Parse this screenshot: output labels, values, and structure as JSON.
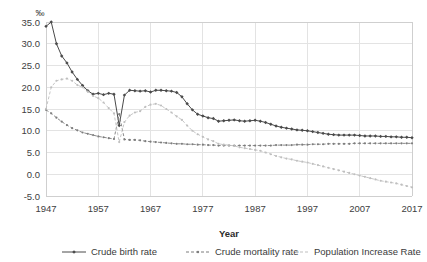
{
  "chart_data": {
    "type": "line",
    "title": "",
    "xlabel": "Year",
    "ylabel": "",
    "unit_symbol": "‰",
    "xlim": [
      1947,
      2017
    ],
    "ylim": [
      -5.0,
      35.0
    ],
    "grid": true,
    "legend_position": "bottom",
    "x_tick_labels": [
      "1947",
      "1957",
      "1967",
      "1977",
      "1987",
      "1997",
      "2007",
      "2017"
    ],
    "x_ticks": [
      1947,
      1957,
      1967,
      1977,
      1987,
      1997,
      2007,
      2017
    ],
    "y_tick_labels": [
      "-5.0",
      "0.0",
      "5.0",
      "10.0",
      "15.0",
      "20.0",
      "25.0",
      "30.0",
      "35.0"
    ],
    "y_ticks": [
      -5,
      0,
      5,
      10,
      15,
      20,
      25,
      30,
      35
    ],
    "x": [
      1947,
      1948,
      1949,
      1950,
      1951,
      1952,
      1953,
      1954,
      1955,
      1956,
      1957,
      1958,
      1959,
      1960,
      1961,
      1962,
      1963,
      1964,
      1965,
      1966,
      1967,
      1968,
      1969,
      1970,
      1971,
      1972,
      1973,
      1974,
      1975,
      1976,
      1977,
      1978,
      1979,
      1980,
      1981,
      1982,
      1983,
      1984,
      1985,
      1986,
      1987,
      1988,
      1989,
      1990,
      1991,
      1992,
      1993,
      1994,
      1995,
      1996,
      1997,
      1998,
      1999,
      2000,
      2001,
      2002,
      2003,
      2004,
      2005,
      2006,
      2007,
      2008,
      2009,
      2010,
      2011,
      2012,
      2013,
      2014,
      2015,
      2016,
      2017
    ],
    "series": [
      {
        "name": "Crude birth rate",
        "color": "#4a4a4a",
        "marker": "diamond",
        "dash": "none",
        "values": [
          34.0,
          35.0,
          30.0,
          27.2,
          25.6,
          23.5,
          21.8,
          20.4,
          19.2,
          18.4,
          18.6,
          18.3,
          18.6,
          18.4,
          11.2,
          18.2,
          19.3,
          19.2,
          19.1,
          19.2,
          18.9,
          19.3,
          19.3,
          19.2,
          19.1,
          18.8,
          17.8,
          16.2,
          14.8,
          13.8,
          13.4,
          13.0,
          12.8,
          12.2,
          12.3,
          12.4,
          12.5,
          12.3,
          12.2,
          12.3,
          12.4,
          12.2,
          11.9,
          11.5,
          11.1,
          10.8,
          10.6,
          10.4,
          10.2,
          10.1,
          10.0,
          9.8,
          9.6,
          9.4,
          9.2,
          9.1,
          9.0,
          9.0,
          9.0,
          9.0,
          8.9,
          8.8,
          8.8,
          8.8,
          8.7,
          8.7,
          8.6,
          8.6,
          8.5,
          8.5,
          8.4
        ]
      },
      {
        "name": "Crude mortality rate",
        "color": "#7d7d7d",
        "marker": "dot",
        "dash": "dash",
        "values": [
          14.8,
          14.0,
          13.0,
          12.1,
          11.3,
          10.6,
          10.1,
          9.6,
          9.3,
          9.0,
          8.7,
          8.5,
          8.3,
          8.1,
          13.8,
          8.0,
          7.9,
          7.9,
          7.8,
          7.6,
          7.5,
          7.4,
          7.3,
          7.2,
          7.1,
          7.0,
          7.0,
          6.9,
          6.9,
          6.8,
          6.8,
          6.7,
          6.7,
          6.6,
          6.6,
          6.6,
          6.6,
          6.6,
          6.6,
          6.6,
          6.6,
          6.6,
          6.6,
          6.6,
          6.7,
          6.7,
          6.7,
          6.7,
          6.8,
          6.8,
          6.8,
          6.9,
          6.9,
          6.9,
          7.0,
          7.0,
          7.0,
          7.0,
          7.0,
          7.1,
          7.1,
          7.1,
          7.1,
          7.1,
          7.1,
          7.1,
          7.1,
          7.1,
          7.1,
          7.1,
          7.1
        ]
      },
      {
        "name": "Population Increase Rate",
        "color": "#bfbfbf",
        "marker": "dot",
        "dash": "dash",
        "values": [
          15.0,
          20.0,
          21.5,
          21.8,
          22.0,
          21.5,
          20.5,
          20.0,
          19.0,
          18.0,
          17.5,
          16.5,
          15.2,
          14.0,
          7.4,
          12.0,
          13.5,
          14.2,
          14.5,
          15.5,
          16.0,
          16.2,
          15.8,
          15.0,
          14.2,
          13.3,
          12.5,
          11.2,
          10.0,
          9.2,
          8.6,
          8.0,
          7.6,
          7.0,
          6.8,
          6.7,
          6.5,
          6.2,
          6.0,
          5.8,
          5.6,
          5.4,
          5.0,
          4.6,
          4.2,
          3.9,
          3.6,
          3.4,
          3.1,
          2.9,
          2.7,
          2.4,
          2.1,
          1.8,
          1.5,
          1.2,
          0.9,
          0.6,
          0.3,
          0.0,
          -0.3,
          -0.6,
          -0.9,
          -1.2,
          -1.5,
          -1.7,
          -1.9,
          -2.1,
          -2.4,
          -2.7,
          -3.0
        ]
      }
    ]
  },
  "legend": {
    "items": [
      {
        "label": "Crude birth rate"
      },
      {
        "label": "Crude mortality rate"
      },
      {
        "label": "Population Increase Rate"
      }
    ]
  }
}
